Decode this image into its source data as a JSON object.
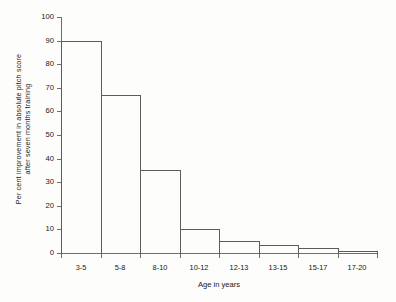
{
  "chart_data": {
    "type": "bar",
    "title": "",
    "subtitle": "",
    "categories": [
      "3-5",
      "5-8",
      "8-10",
      "10-12",
      "12-13",
      "13-15",
      "15-17",
      "17-20"
    ],
    "values": [
      90,
      67,
      35,
      10,
      5,
      3.5,
      2,
      1
    ],
    "xlabel": "Age in years",
    "ylabel_line1": "Per cent improvement in absolute pitch score",
    "ylabel_line2": "after seven months training",
    "ylim": [
      0,
      100
    ],
    "ytick_values": [
      0,
      10,
      20,
      30,
      40,
      50,
      60,
      70,
      80,
      90,
      100
    ],
    "ytick_labels": [
      "0",
      "10",
      "20",
      "30",
      "40",
      "50",
      "60",
      "70",
      "80",
      "90",
      "100"
    ],
    "grid": false,
    "legend": null,
    "bar_style": "outline-step-histogram",
    "bar_line_color": "#5c5c5c",
    "axis_color": "#6f6f6f",
    "background_color": "#fdfdfc",
    "text_color": "#171717"
  }
}
